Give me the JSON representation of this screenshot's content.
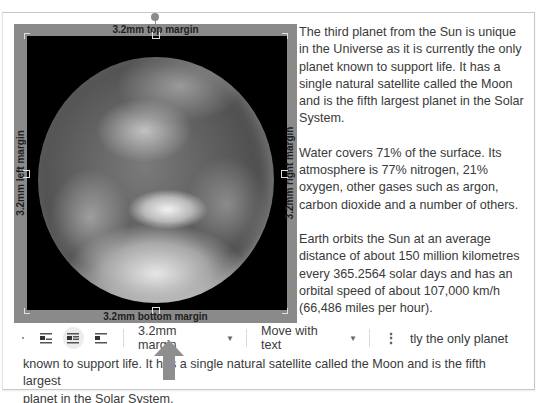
{
  "image": {
    "alt": "Earth",
    "margin_labels": {
      "top": "3.2mm top margin",
      "bottom": "3.2mm bottom margin",
      "left": "3.2mm left margin",
      "right": "3.2mm right margin"
    }
  },
  "document": {
    "paragraphs": [
      "The third planet from the Sun is unique in the Universe as it is currently the only planet known to support life. It has a single natural satellite called the Moon and is the fifth largest planet in the Solar System.",
      "Water covers 71% of the surface. Its atmosphere is 77% nitrogen, 21% oxygen, other gases such as argon, carbon dioxide and a number of others.",
      "Earth orbits the Sun at an average distance of about 150 million kilometres every 365.2564 solar days and has an orbital speed of about 107,000 km/h (66,486 miles per hour)."
    ],
    "partial_line": "tly the only planet",
    "bottom_lines": [
      "known to support life. It has a single natural satellite called the Moon and is the fifth largest",
      "planet in the Solar System."
    ]
  },
  "toolbar": {
    "wrap_options": [
      {
        "icon": "inline-icon",
        "active": false
      },
      {
        "icon": "wrap-text-icon",
        "active": true
      },
      {
        "icon": "break-text-icon",
        "active": false
      }
    ],
    "margin_select": "3.2mm margin",
    "position_select": "Move with text",
    "more_icon": "more-vert-icon"
  },
  "colors": {
    "frame": "#8a8a8a",
    "arrow": "#8e8e8e",
    "text": "#3a3a3a"
  }
}
